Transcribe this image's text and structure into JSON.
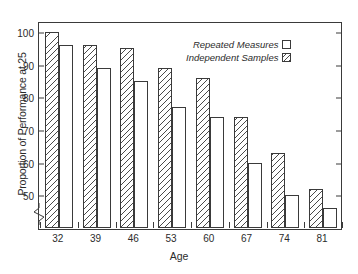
{
  "chart_data": {
    "type": "bar",
    "title": "",
    "xlabel": "Age",
    "ylabel": "Proportion of Performance at 25",
    "categories": [
      "32",
      "39",
      "46",
      "53",
      "60",
      "67",
      "74",
      "81"
    ],
    "series": [
      {
        "name": "Independent Samples",
        "fill": "hatched",
        "values": [
          100,
          96,
          95,
          89,
          86,
          74,
          63,
          52
        ]
      },
      {
        "name": "Repeated Measures",
        "fill": "open",
        "values": [
          96,
          89,
          85,
          77,
          74,
          60,
          50,
          46
        ]
      }
    ],
    "ylim": [
      40,
      103
    ],
    "yticks": [
      50,
      60,
      70,
      80,
      90,
      100
    ],
    "ytick_labels": [
      "50",
      "60",
      "70",
      "80",
      "90",
      "100"
    ],
    "y_axis_break": true,
    "y_axis_break_below": 50,
    "grid": false,
    "legend_position": "upper-right-inside",
    "frame": true,
    "axis_color": "#3a3a3a",
    "bar_edge_color": "#3a3a3a",
    "hatch_color": "#4a4a4a",
    "background": "#ffffff"
  },
  "legend": {
    "entries": [
      {
        "label": "Repeated Measures",
        "swatch": "open-square-icon"
      },
      {
        "label": "Independent Samples",
        "swatch": "hatched-square-icon"
      }
    ]
  }
}
